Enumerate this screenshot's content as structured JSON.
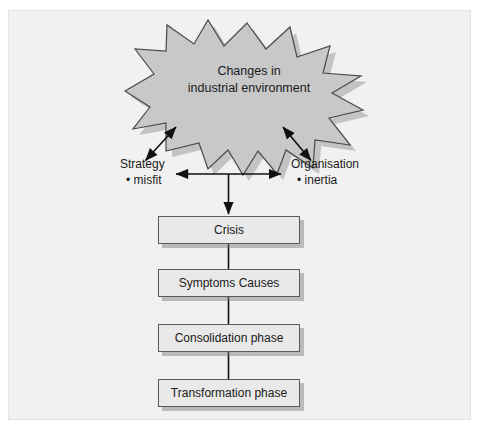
{
  "figure": {
    "name": "change-process-diagram",
    "colors": {
      "panel_background": "#f1f1f1",
      "page_background": "#ffffff",
      "burst_fill": "#c8c8c8",
      "burst_stroke": "#4a4a4a",
      "box_fill": "#e9e9e9",
      "box_stroke": "#5a5a5a",
      "shadow": "#9a9a9a",
      "text": "#1a1a1a",
      "connector": "#111111"
    }
  },
  "burst": {
    "icon": "starburst-shape",
    "line1": "Changes in",
    "line2": "industrial environment",
    "points": 16
  },
  "labels": {
    "left": {
      "heading": "Strategy",
      "bullet": "• misfit"
    },
    "right": {
      "heading": "Organisation",
      "bullet": "• inertia"
    }
  },
  "connectors": {
    "burst_to_left": "double-headed-diagonal-arrow",
    "burst_to_right": "double-headed-diagonal-arrow",
    "left_right_link": "double-headed-horizontal-arrow",
    "down_to_crisis": "down-arrow",
    "chain": "vertical-line"
  },
  "boxes": [
    {
      "id": "crisis",
      "label": "Crisis"
    },
    {
      "id": "symptoms",
      "label": "Symptoms Causes"
    },
    {
      "id": "consolidation",
      "label": "Consolidation phase"
    },
    {
      "id": "transformation",
      "label": "Transformation phase"
    }
  ]
}
